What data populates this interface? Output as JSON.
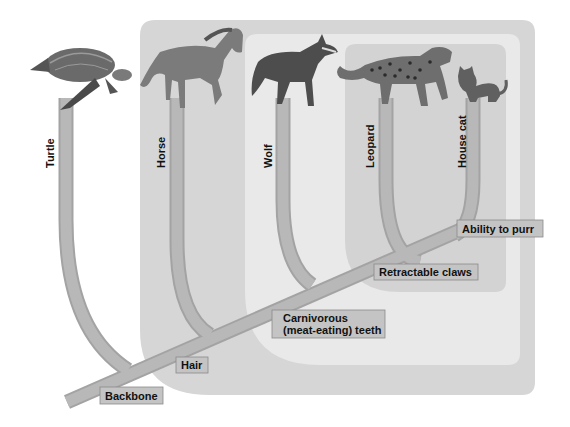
{
  "colors": {
    "background": "#ffffff",
    "outer_group": "#d6d6d6",
    "middle_group": "#e8e8e8",
    "inner_group": "#d2d2d2",
    "branch": "#b4b4b4",
    "branch_shadow": "#9c9c9c",
    "label_box": "#c4c4c4",
    "label_border": "#8a8a8a"
  },
  "taxa": [
    {
      "id": "turtle",
      "label": "Turtle"
    },
    {
      "id": "horse",
      "label": "Horse"
    },
    {
      "id": "wolf",
      "label": "Wolf"
    },
    {
      "id": "leopard",
      "label": "Leopard"
    },
    {
      "id": "house-cat",
      "label": "House cat"
    }
  ],
  "traits": [
    {
      "id": "backbone",
      "label": "Backbone"
    },
    {
      "id": "hair",
      "label": "Hair"
    },
    {
      "id": "carnivorous-teeth",
      "line1": "Carnivorous",
      "line2": "(meat-eating) teeth"
    },
    {
      "id": "retractable-claws",
      "label": "Retractable claws"
    },
    {
      "id": "ability-to-purr",
      "label": "Ability to purr"
    }
  ]
}
